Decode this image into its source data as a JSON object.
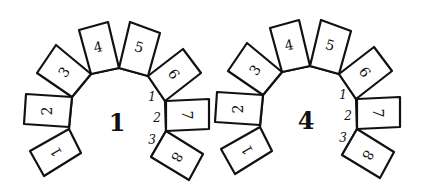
{
  "figures": [
    {
      "label": "1",
      "cards": [
        "1",
        "2",
        "3",
        "4",
        "5",
        "6",
        "7",
        "8"
      ],
      "hinge_labels": [
        "1",
        "2",
        "3"
      ]
    },
    {
      "label": "4",
      "cards": [
        "1",
        "2",
        "3",
        "4",
        "5",
        "6",
        "7",
        "8"
      ],
      "hinge_labels": [
        "1",
        "2",
        "3"
      ]
    }
  ]
}
